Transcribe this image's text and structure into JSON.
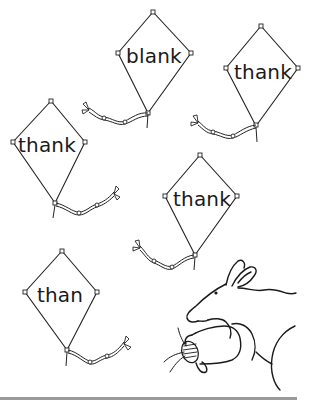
{
  "worksheet": {
    "kites": [
      {
        "word": "blank",
        "top": [
          153,
          12
        ],
        "left": [
          118,
          53
        ],
        "right": [
          191,
          53
        ],
        "bottom": [
          148,
          113
        ],
        "label_pos": [
          154,
          56
        ]
      },
      {
        "word": "thank",
        "top": [
          261,
          26
        ],
        "left": [
          226,
          68
        ],
        "right": [
          298,
          68
        ],
        "bottom": [
          256,
          126
        ],
        "label_pos": [
          263,
          72
        ]
      },
      {
        "word": "thank",
        "top": [
          51,
          101
        ],
        "left": [
          13,
          142
        ],
        "right": [
          85,
          142
        ],
        "bottom": [
          55,
          203
        ],
        "label_pos": [
          47,
          145
        ]
      },
      {
        "word": "thank",
        "top": [
          200,
          155
        ],
        "left": [
          165,
          196
        ],
        "right": [
          237,
          196
        ],
        "bottom": [
          195,
          255
        ],
        "label_pos": [
          202,
          199
        ]
      },
      {
        "word": "than",
        "top": [
          62,
          251
        ],
        "left": [
          25,
          292
        ],
        "right": [
          97,
          292
        ],
        "bottom": [
          67,
          350
        ],
        "label_pos": [
          60,
          295
        ]
      }
    ],
    "illustration": "kangaroo-holding-string-spool",
    "rule_color": "#9a9a9a"
  }
}
